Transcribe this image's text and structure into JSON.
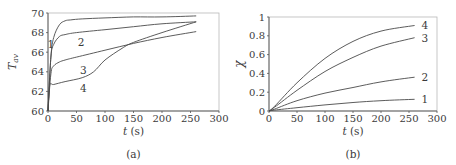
{
  "chart_data": [
    {
      "type": "line",
      "panel_label": "(a)",
      "title": "",
      "xlabel": "t (s)",
      "ylabel": "T_av",
      "xlim": [
        0,
        300
      ],
      "ylim": [
        60,
        70
      ],
      "xticks": [
        0,
        50,
        100,
        150,
        200,
        250,
        300
      ],
      "yticks": [
        60,
        62,
        64,
        66,
        68,
        70
      ],
      "grid": false,
      "legend": "inline curve labels 1-4",
      "series": [
        {
          "name": "1",
          "x": [
            0,
            5,
            10,
            20,
            30,
            40,
            60,
            100,
            150,
            200,
            260
          ],
          "y": [
            60,
            65.5,
            67.5,
            68.8,
            69.2,
            69.3,
            69.4,
            69.5,
            69.6,
            69.6,
            69.7
          ]
        },
        {
          "name": "2",
          "x": [
            0,
            5,
            10,
            20,
            30,
            50,
            100,
            150,
            200,
            260
          ],
          "y": [
            60,
            65.5,
            66.8,
            67.6,
            67.8,
            68.0,
            68.3,
            68.6,
            68.9,
            69.1
          ]
        },
        {
          "name": "3",
          "x": [
            0,
            5,
            10,
            20,
            30,
            50,
            100,
            150,
            200,
            260
          ],
          "y": [
            60,
            63.8,
            64.6,
            65.0,
            65.2,
            65.5,
            66.2,
            66.9,
            67.5,
            68.1
          ]
        },
        {
          "name": "4",
          "x": [
            0,
            3,
            10,
            30,
            60,
            80,
            100,
            130,
            150,
            200,
            260
          ],
          "y": [
            60,
            62.6,
            62.7,
            63.0,
            63.4,
            64.0,
            65.2,
            66.4,
            67.0,
            68.0,
            69.1
          ]
        }
      ],
      "label_positions": {
        "1": [
          5,
          66.8
        ],
        "2": [
          58,
          67.0
        ],
        "3": [
          62,
          64.2
        ],
        "4": [
          62,
          62.3
        ]
      }
    },
    {
      "type": "line",
      "panel_label": "(b)",
      "title": "",
      "xlabel": "t (s)",
      "ylabel": "χ",
      "xlim": [
        0,
        300
      ],
      "ylim": [
        0,
        1
      ],
      "xticks": [
        0,
        50,
        100,
        150,
        200,
        250,
        300
      ],
      "yticks": [
        0,
        0.2,
        0.4,
        0.6,
        0.8,
        1
      ],
      "grid": false,
      "legend": "inline curve labels 1-4 at right end",
      "series": [
        {
          "name": "1",
          "x": [
            0,
            10,
            50,
            100,
            150,
            200,
            260
          ],
          "y": [
            0,
            0.01,
            0.035,
            0.065,
            0.09,
            0.11,
            0.125
          ]
        },
        {
          "name": "2",
          "x": [
            0,
            10,
            50,
            100,
            150,
            200,
            260
          ],
          "y": [
            0,
            0.02,
            0.11,
            0.19,
            0.25,
            0.31,
            0.36
          ]
        },
        {
          "name": "3",
          "x": [
            0,
            10,
            50,
            100,
            150,
            200,
            260
          ],
          "y": [
            0,
            0.04,
            0.22,
            0.42,
            0.57,
            0.69,
            0.78
          ]
        },
        {
          "name": "4",
          "x": [
            0,
            10,
            50,
            100,
            150,
            200,
            260
          ],
          "y": [
            0,
            0.05,
            0.3,
            0.56,
            0.74,
            0.85,
            0.91
          ]
        }
      ]
    }
  ]
}
